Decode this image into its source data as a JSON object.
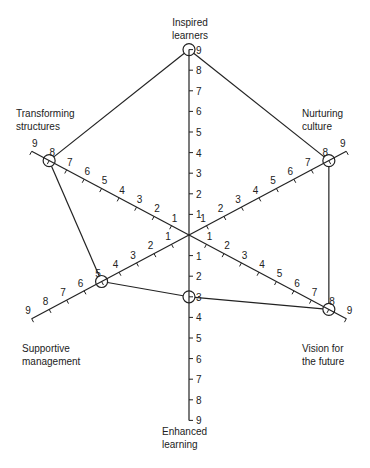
{
  "chart_data": {
    "type": "radar",
    "title": "",
    "scale": {
      "min": 0,
      "max": 9,
      "ticks": [
        1,
        2,
        3,
        4,
        5,
        6,
        7,
        8,
        9
      ]
    },
    "axes": [
      {
        "label": "Inspired learners",
        "value": 9
      },
      {
        "label": "Nurturing culture",
        "value": 8
      },
      {
        "label": "Vision for the future",
        "value": 8
      },
      {
        "label": "Enhanced learning",
        "value": 3
      },
      {
        "label": "Supportive management",
        "value": 5
      },
      {
        "label": "Transforming structures",
        "value": 8
      }
    ],
    "series": [
      {
        "name": "profile",
        "values": [
          9,
          8,
          8,
          3,
          5,
          8
        ]
      }
    ],
    "grid": false,
    "legend": "none"
  },
  "labels": {
    "inspired_line1": "Inspired",
    "inspired_line2": "learners",
    "nurturing_line1": "Nurturing",
    "nurturing_line2": "culture",
    "vision_line1": "Vision for",
    "vision_line2": "the future",
    "enhanced_line1": "Enhanced",
    "enhanced_line2": "learning",
    "supportive_line1": "Supportive",
    "supportive_line2": "management",
    "transforming_line1": "Transforming",
    "transforming_line2": "structures"
  },
  "colors": {
    "line": "#222222",
    "background": "#ffffff"
  }
}
